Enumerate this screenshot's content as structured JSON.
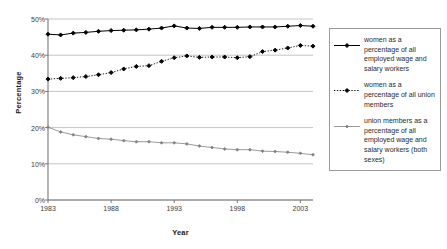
{
  "chart_data": {
    "type": "line",
    "title": "",
    "xlabel": "Year",
    "ylabel": "Percentage",
    "xlim": [
      1983,
      2004
    ],
    "ylim": [
      0,
      50
    ],
    "ytick_labels": [
      "0%",
      "10%",
      "20%",
      "30%",
      "40%",
      "50%"
    ],
    "ytick_values": [
      0,
      10,
      20,
      30,
      40,
      50
    ],
    "xtick_labels": [
      "1983",
      "1988",
      "1993",
      "1998",
      "2003"
    ],
    "xtick_values": [
      1983,
      1988,
      1993,
      1998,
      2003
    ],
    "grid": "horizontal",
    "legend_position": "right",
    "x": [
      1983,
      1984,
      1985,
      1986,
      1987,
      1988,
      1989,
      1990,
      1991,
      1992,
      1993,
      1994,
      1995,
      1996,
      1997,
      1998,
      1999,
      2000,
      2001,
      2002,
      2003,
      2004
    ],
    "series": [
      {
        "name": "women as a percentage of all employed wage and salary workers",
        "marker": "diamond",
        "line_style": "solid",
        "color": "#000000",
        "values": [
          45.8,
          45.6,
          46.1,
          46.3,
          46.6,
          46.8,
          46.9,
          47.0,
          47.2,
          47.5,
          48.1,
          47.5,
          47.4,
          47.7,
          47.7,
          47.7,
          47.8,
          47.8,
          47.8,
          48.0,
          48.2,
          48.0
        ]
      },
      {
        "name": "women as a percentage of all union members",
        "marker": "diamond",
        "line_style": "dotted",
        "color": "#000000",
        "values": [
          33.4,
          33.6,
          33.8,
          34.1,
          34.6,
          35.2,
          36.2,
          36.9,
          37.1,
          38.3,
          39.3,
          39.8,
          39.4,
          39.5,
          39.5,
          39.3,
          39.6,
          41.0,
          41.4,
          42.0,
          42.7,
          42.5
        ]
      },
      {
        "name": "union members as a percentage of all employed wage and salary workers (both sexes)",
        "marker": "diamond",
        "line_style": "solid",
        "color": "#808080",
        "values": [
          20.1,
          18.8,
          18.0,
          17.5,
          17.0,
          16.8,
          16.4,
          16.1,
          16.1,
          15.8,
          15.8,
          15.5,
          14.9,
          14.5,
          14.1,
          13.9,
          13.9,
          13.5,
          13.4,
          13.2,
          12.9,
          12.5
        ]
      }
    ]
  },
  "legend": {
    "items": [
      {
        "label": "women as a percentage of all employed wage and salary workers"
      },
      {
        "label": "women as a percentage of all union members"
      },
      {
        "label": "union members as a percentage of all employed wage and salary workers (both sexes)"
      }
    ]
  }
}
